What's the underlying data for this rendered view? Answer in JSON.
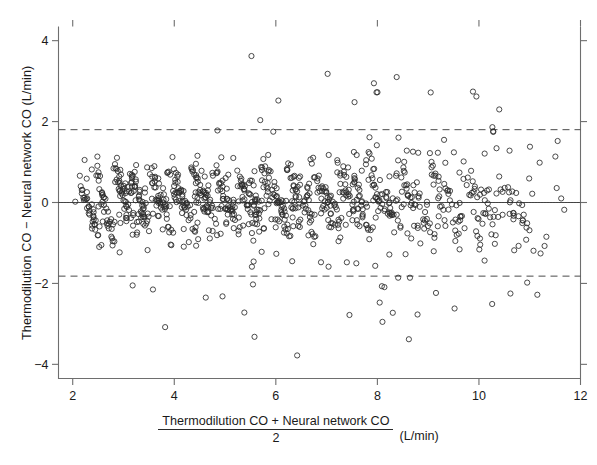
{
  "figure": {
    "kind": "bland-altman-scatter",
    "background": "#ffffff",
    "ink_color": "#2a2a2a"
  },
  "axes": {
    "y_label": "Thermodilution CO − Neural network CO (L/min)",
    "x_label_numerator": "Thermodilution CO + Neural network CO",
    "x_label_denominator": "2",
    "x_label_units": "(L/min)",
    "x_ticks": [
      "2",
      "4",
      "6",
      "8",
      "10",
      "12"
    ],
    "y_ticks": [
      "4",
      "2",
      "0",
      "−2",
      "−4"
    ]
  },
  "chart_data": {
    "type": "scatter",
    "title": "",
    "xlabel": "(Thermodilution CO + Neural network CO) / 2 (L/min)",
    "ylabel": "Thermodilution CO − Neural network CO (L/min)",
    "xlim": [
      1.72,
      12.0
    ],
    "ylim": [
      -4.35,
      4.35
    ],
    "xticks": [
      2,
      4,
      6,
      8,
      10,
      12
    ],
    "yticks": [
      -4,
      -2,
      0,
      2,
      4
    ],
    "grid": false,
    "legend": null,
    "marker": "open-circle",
    "marker_size_px": 5.2,
    "reference_lines": [
      {
        "name": "mean-bias-line",
        "style": "solid",
        "y": 0.0,
        "label": ""
      },
      {
        "name": "zero-line",
        "style": "dotted",
        "y": 0.0,
        "label": ""
      },
      {
        "name": "upper-limit-of-agreement",
        "style": "dashed",
        "y": 1.8,
        "label": ""
      },
      {
        "name": "lower-limit-of-agreement",
        "style": "dashed",
        "y": -1.82,
        "label": ""
      }
    ],
    "n_points": 980,
    "clusters": [
      {
        "cx": 2.25,
        "cy": 0.1,
        "n": 16,
        "sx": 0.09,
        "sy": 0.3,
        "slope": -3.2
      },
      {
        "cx": 2.42,
        "cy": -0.38,
        "n": 18,
        "sx": 0.1,
        "sy": 0.34,
        "slope": -3.4
      },
      {
        "cx": 2.58,
        "cy": 0.22,
        "n": 14,
        "sx": 0.08,
        "sy": 0.28,
        "slope": -2.8
      },
      {
        "cx": 2.72,
        "cy": -0.55,
        "n": 20,
        "sx": 0.11,
        "sy": 0.4,
        "slope": -3.6
      },
      {
        "cx": 2.95,
        "cy": 0.34,
        "n": 22,
        "sx": 0.1,
        "sy": 0.36,
        "slope": -3.1
      },
      {
        "cx": 3.08,
        "cy": -0.12,
        "n": 24,
        "sx": 0.11,
        "sy": 0.42,
        "slope": -3.3
      },
      {
        "cx": 3.25,
        "cy": 0.28,
        "n": 26,
        "sx": 0.1,
        "sy": 0.4,
        "slope": -3.5
      },
      {
        "cx": 3.42,
        "cy": -0.3,
        "n": 20,
        "sx": 0.1,
        "sy": 0.36,
        "slope": -3.0
      },
      {
        "cx": 3.62,
        "cy": 0.4,
        "n": 24,
        "sx": 0.11,
        "sy": 0.44,
        "slope": -3.4
      },
      {
        "cx": 3.82,
        "cy": -0.2,
        "n": 22,
        "sx": 0.1,
        "sy": 0.38,
        "slope": -3.2
      },
      {
        "cx": 4.05,
        "cy": 0.3,
        "n": 26,
        "sx": 0.12,
        "sy": 0.46,
        "slope": -3.3
      },
      {
        "cx": 4.28,
        "cy": -0.25,
        "n": 22,
        "sx": 0.11,
        "sy": 0.4,
        "slope": -3.1
      },
      {
        "cx": 4.48,
        "cy": 0.36,
        "n": 28,
        "sx": 0.12,
        "sy": 0.48,
        "slope": -3.4
      },
      {
        "cx": 4.7,
        "cy": -0.1,
        "n": 26,
        "sx": 0.12,
        "sy": 0.44,
        "slope": -3.2
      },
      {
        "cx": 4.92,
        "cy": 0.32,
        "n": 24,
        "sx": 0.11,
        "sy": 0.44,
        "slope": -3.3
      },
      {
        "cx": 5.15,
        "cy": -0.3,
        "n": 22,
        "sx": 0.12,
        "sy": 0.42,
        "slope": -3.0
      },
      {
        "cx": 5.38,
        "cy": 0.24,
        "n": 26,
        "sx": 0.12,
        "sy": 0.46,
        "slope": -3.4
      },
      {
        "cx": 5.62,
        "cy": -0.18,
        "n": 24,
        "sx": 0.12,
        "sy": 0.44,
        "slope": -3.2
      },
      {
        "cx": 5.88,
        "cy": 0.3,
        "n": 26,
        "sx": 0.13,
        "sy": 0.48,
        "slope": -3.3
      },
      {
        "cx": 6.12,
        "cy": -0.22,
        "n": 24,
        "sx": 0.12,
        "sy": 0.44,
        "slope": -3.1
      },
      {
        "cx": 6.38,
        "cy": 0.34,
        "n": 26,
        "sx": 0.13,
        "sy": 0.5,
        "slope": -3.4
      },
      {
        "cx": 6.62,
        "cy": -0.15,
        "n": 22,
        "sx": 0.12,
        "sy": 0.46,
        "slope": -3.2
      },
      {
        "cx": 6.88,
        "cy": 0.26,
        "n": 24,
        "sx": 0.13,
        "sy": 0.48,
        "slope": -3.3
      },
      {
        "cx": 7.15,
        "cy": -0.28,
        "n": 22,
        "sx": 0.13,
        "sy": 0.46,
        "slope": -3.0
      },
      {
        "cx": 7.42,
        "cy": 0.3,
        "n": 24,
        "sx": 0.13,
        "sy": 0.5,
        "slope": -3.4
      },
      {
        "cx": 7.7,
        "cy": -0.2,
        "n": 22,
        "sx": 0.13,
        "sy": 0.48,
        "slope": -3.2
      },
      {
        "cx": 7.98,
        "cy": 0.28,
        "n": 22,
        "sx": 0.14,
        "sy": 0.5,
        "slope": -3.3
      },
      {
        "cx": 8.28,
        "cy": -0.25,
        "n": 20,
        "sx": 0.13,
        "sy": 0.48,
        "slope": -3.1
      },
      {
        "cx": 8.58,
        "cy": 0.3,
        "n": 20,
        "sx": 0.14,
        "sy": 0.52,
        "slope": -3.4
      },
      {
        "cx": 8.88,
        "cy": -0.18,
        "n": 18,
        "sx": 0.14,
        "sy": 0.5,
        "slope": -3.2
      },
      {
        "cx": 9.2,
        "cy": 0.26,
        "n": 18,
        "sx": 0.14,
        "sy": 0.52,
        "slope": -3.3
      },
      {
        "cx": 9.52,
        "cy": -0.22,
        "n": 16,
        "sx": 0.14,
        "sy": 0.5,
        "slope": -3.0
      },
      {
        "cx": 9.85,
        "cy": 0.3,
        "n": 16,
        "sx": 0.15,
        "sy": 0.54,
        "slope": -3.4
      },
      {
        "cx": 10.18,
        "cy": -0.2,
        "n": 14,
        "sx": 0.15,
        "sy": 0.52,
        "slope": -3.2
      },
      {
        "cx": 10.52,
        "cy": 0.22,
        "n": 12,
        "sx": 0.15,
        "sy": 0.54,
        "slope": -3.3
      },
      {
        "cx": 10.88,
        "cy": -0.25,
        "n": 10,
        "sx": 0.15,
        "sy": 0.5,
        "slope": -3.0
      }
    ],
    "scatter_background": {
      "n": 230,
      "x_range": [
        2.0,
        11.6
      ],
      "y_sd": 0.95
    },
    "outliers": [
      {
        "x": 5.52,
        "y": 3.62
      },
      {
        "x": 7.02,
        "y": 3.18
      },
      {
        "x": 8.38,
        "y": 3.1
      },
      {
        "x": 9.05,
        "y": 2.72
      },
      {
        "x": 9.95,
        "y": 2.62
      },
      {
        "x": 6.05,
        "y": 2.52
      },
      {
        "x": 7.55,
        "y": 2.48
      },
      {
        "x": 10.4,
        "y": 2.3
      },
      {
        "x": 4.85,
        "y": 1.78
      },
      {
        "x": 5.95,
        "y": 1.75
      },
      {
        "x": 10.28,
        "y": 1.76
      },
      {
        "x": 11.55,
        "y": 1.52
      },
      {
        "x": 11.62,
        "y": 0.1
      },
      {
        "x": 11.68,
        "y": -0.18
      },
      {
        "x": 2.05,
        "y": 0.02
      },
      {
        "x": 3.18,
        "y": -2.05
      },
      {
        "x": 3.58,
        "y": -2.15
      },
      {
        "x": 4.62,
        "y": -2.35
      },
      {
        "x": 4.95,
        "y": -2.32
      },
      {
        "x": 5.38,
        "y": -2.72
      },
      {
        "x": 3.82,
        "y": -3.08
      },
      {
        "x": 5.58,
        "y": -3.32
      },
      {
        "x": 6.42,
        "y": -3.78
      },
      {
        "x": 7.45,
        "y": -2.78
      },
      {
        "x": 8.1,
        "y": -2.95
      },
      {
        "x": 8.62,
        "y": -3.38
      },
      {
        "x": 9.52,
        "y": -2.62
      },
      {
        "x": 10.62,
        "y": -2.25
      },
      {
        "x": 11.15,
        "y": -2.28
      },
      {
        "x": 10.95,
        "y": -1.98
      }
    ]
  }
}
